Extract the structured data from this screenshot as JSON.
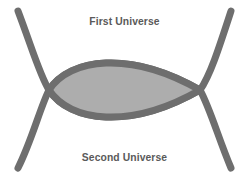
{
  "figure": {
    "name": "two-intersecting-universes-diagram",
    "width": 249,
    "height": 179,
    "background_color": "#ffffff",
    "labels": {
      "top": "First Universe",
      "bottom": "Second Universe"
    },
    "label_color": "#5a5a5a",
    "shapes": {
      "arc_stroke_color": "#6e6e6e",
      "arc_stroke_width": 7,
      "lens_fill_color": "#adadad",
      "lens_stroke_color": "#6e6e6e",
      "lens_stroke_width": 7,
      "intersection_left": {
        "x": 49,
        "y": 90
      },
      "intersection_right": {
        "x": 200,
        "y": 90
      },
      "lens_top_y": 54,
      "lens_bottom_y": 126,
      "arc_endpoints": [
        {
          "name": "top-left",
          "x": 18,
          "y": 11
        },
        {
          "name": "top-right",
          "x": 231,
          "y": 11
        },
        {
          "name": "bottom-left",
          "x": 18,
          "y": 168
        },
        {
          "name": "bottom-right",
          "x": 231,
          "y": 168
        }
      ]
    }
  }
}
